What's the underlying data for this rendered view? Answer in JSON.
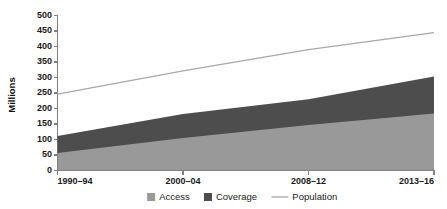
{
  "chart_data": {
    "type": "area",
    "title": "",
    "xlabel": "",
    "ylabel": "Millions",
    "categories": [
      "1990–94",
      "2000–04",
      "2008–12",
      "2013–16"
    ],
    "x_positions": [
      0,
      1,
      2,
      3
    ],
    "ylim": [
      0,
      500
    ],
    "y_ticks": [
      0,
      50,
      100,
      150,
      200,
      250,
      300,
      350,
      400,
      450,
      500
    ],
    "grid": false,
    "stacked": true,
    "legend_position": "bottom",
    "series": [
      {
        "name": "Access",
        "type": "area",
        "color": "#999999",
        "values": [
          55,
          103,
          145,
          182
        ]
      },
      {
        "name": "Coverage",
        "type": "area",
        "color": "#4d4d4d",
        "values": [
          55,
          78,
          83,
          120
        ]
      },
      {
        "name": "Population",
        "type": "line",
        "color": "#a8a8a8",
        "values": [
          245,
          320,
          388,
          443
        ]
      }
    ],
    "stacked_tops": {
      "access": [
        55,
        103,
        145,
        182
      ],
      "coverage_cumulative": [
        110,
        181,
        228,
        302
      ]
    },
    "annotations": []
  },
  "axis": {
    "y_title": "Millions",
    "y_tick_labels": [
      "500",
      "450",
      "400",
      "350",
      "300",
      "250",
      "200",
      "150",
      "100",
      "50",
      "0"
    ],
    "x_tick_labels": [
      "1990–94",
      "2000–04",
      "2008–12",
      "2013–16"
    ]
  },
  "legend": {
    "items": [
      {
        "label": "Access",
        "marker": "square",
        "color": "#999999"
      },
      {
        "label": "Coverage",
        "marker": "square",
        "color": "#4d4d4d"
      },
      {
        "label": "Population",
        "marker": "line",
        "color": "#a8a8a8"
      }
    ]
  },
  "colors": {
    "access": "#999999",
    "coverage": "#4d4d4d",
    "population": "#a8a8a8",
    "axis": "#808080",
    "text": "#1a1a1a",
    "background": "#ffffff"
  }
}
